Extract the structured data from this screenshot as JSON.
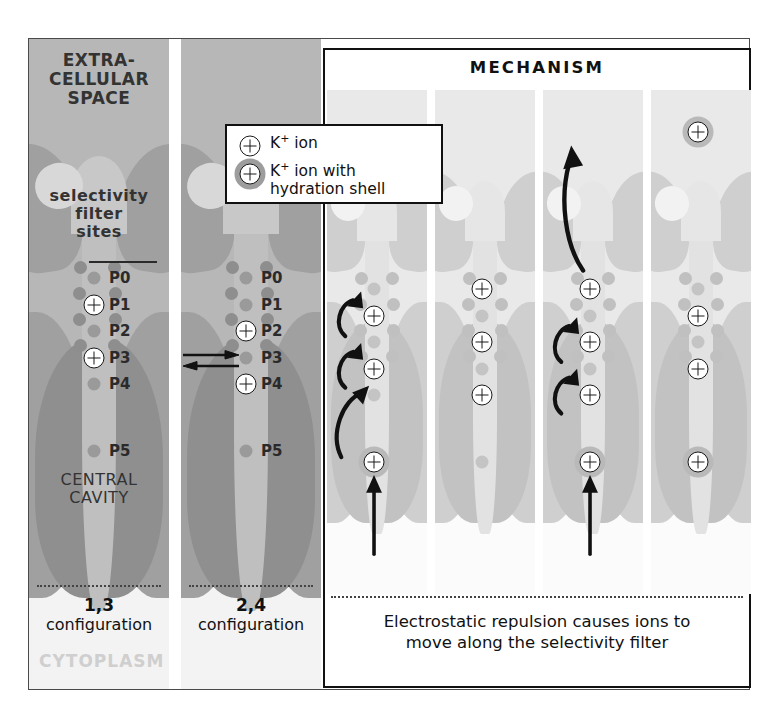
{
  "figure": {
    "extracellular_label": "EXTRA-\nCELLULAR\nSPACE",
    "extracellular_line1": "EXTRA-",
    "extracellular_line2": "CELLULAR",
    "extracellular_line3": "SPACE",
    "selectivity_label_line1": "selectivity",
    "selectivity_label_line2": "filter",
    "selectivity_label_line3": "sites",
    "central_cavity_line1": "CENTRAL",
    "central_cavity_line2": "CAVITY",
    "cytoplasm_label": "CYTOPLASM"
  },
  "legend": {
    "items": [
      {
        "icon": "k-ion-icon",
        "label": "K",
        "sup": "+",
        "rest": " ion",
        "hydrated": false
      },
      {
        "icon": "k-ion-hydrated-icon",
        "label": "K",
        "sup": "+",
        "rest": " ion with",
        "line2": "hydration shell",
        "hydrated": true
      }
    ]
  },
  "site_labels": [
    "P0",
    "P1",
    "P2",
    "P3",
    "P4",
    "P5"
  ],
  "panels": {
    "config13": {
      "name": "1,3 configuration",
      "caption_bold": "1,3",
      "caption_rest": "configuration",
      "ion_sites": [
        "P1",
        "P3"
      ],
      "show_site_labels": true,
      "background": "#b7b7b7"
    },
    "config24": {
      "name": "2,4 configuration",
      "caption_bold": "2,4",
      "caption_rest": "configuration",
      "ion_sites": [
        "P2",
        "P4"
      ],
      "show_site_labels": true,
      "background": "#b7b7b7"
    }
  },
  "mechanism": {
    "title": "MECHANISM",
    "caption_line1": "Electrostatic repulsion causes ions to",
    "caption_line2": "move along the selectivity filter",
    "steps": [
      {
        "step": 1,
        "ion_sites": [
          "P1",
          "P3"
        ],
        "cavity_ion": true,
        "cavity_ion_hydrated": true,
        "extracellular_ion": false,
        "curved_arrows": 3,
        "straight_arrow": true,
        "exit_arrow": false
      },
      {
        "step": 2,
        "ion_sites": [
          "P0",
          "P2",
          "P4"
        ],
        "cavity_ion": false,
        "cavity_ion_hydrated": false,
        "extracellular_ion": false,
        "curved_arrows": 0,
        "straight_arrow": false,
        "exit_arrow": false
      },
      {
        "step": 3,
        "ion_sites": [
          "P0",
          "P2",
          "P4"
        ],
        "cavity_ion": true,
        "cavity_ion_hydrated": true,
        "extracellular_ion": false,
        "curved_arrows": 2,
        "straight_arrow": true,
        "exit_arrow": true
      },
      {
        "step": 4,
        "ion_sites": [
          "P1",
          "P3"
        ],
        "cavity_ion": true,
        "cavity_ion_hydrated": true,
        "extracellular_ion": true,
        "curved_arrows": 0,
        "straight_arrow": false,
        "exit_arrow": false
      }
    ]
  },
  "colors": {
    "panel_dark_bg": "#b7b7b7",
    "panel_light_bg": "#e9e9e9",
    "protein_mid": "#a0a0a0",
    "protein_dark": "#8f8f8f",
    "ion_stroke": "#1a1a1a",
    "frame": "#4a4a4a",
    "cytoplasm_text": "#cfcfcf"
  }
}
